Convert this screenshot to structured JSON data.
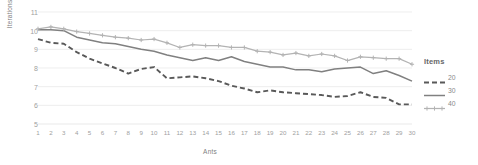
{
  "chart_data": {
    "type": "line",
    "title": "",
    "xlabel": "Ants",
    "ylabel": "Iterations",
    "xlim": [
      1,
      30
    ],
    "ylim": [
      5,
      11
    ],
    "grid": true,
    "legend_position": "right",
    "legend_title": "Items",
    "x": [
      1,
      2,
      3,
      4,
      5,
      6,
      7,
      8,
      9,
      10,
      11,
      12,
      13,
      14,
      15,
      16,
      17,
      18,
      19,
      20,
      21,
      22,
      23,
      24,
      25,
      26,
      27,
      28,
      29,
      30
    ],
    "xticklabels": [
      "1",
      "2",
      "3",
      "4",
      "5",
      "6",
      "7",
      "8",
      "9",
      "10",
      "11",
      "12",
      "13",
      "14",
      "15",
      "16",
      "17",
      "18",
      "19",
      "20",
      "21",
      "22",
      "23",
      "24",
      "25",
      "26",
      "27",
      "28",
      "29",
      "30"
    ],
    "yticklabels": [
      "5",
      "6",
      "7",
      "8",
      "9",
      "10",
      "11"
    ],
    "yticks": [
      5,
      6,
      7,
      8,
      9,
      10,
      11
    ],
    "series": [
      {
        "name": "20",
        "style": "dashed",
        "color": "#595959",
        "marker": "none",
        "values": [
          9.55,
          9.35,
          9.3,
          8.85,
          8.5,
          8.25,
          8.0,
          7.7,
          7.95,
          8.05,
          7.45,
          7.5,
          7.55,
          7.45,
          7.3,
          7.05,
          6.9,
          6.7,
          6.8,
          6.7,
          6.65,
          6.6,
          6.55,
          6.45,
          6.5,
          6.7,
          6.45,
          6.4,
          6.05,
          6.05
        ]
      },
      {
        "name": "30",
        "style": "solid",
        "color": "#808080",
        "marker": "none",
        "values": [
          10.05,
          10.05,
          10.0,
          9.65,
          9.5,
          9.35,
          9.3,
          9.15,
          9.0,
          8.9,
          8.7,
          8.55,
          8.4,
          8.55,
          8.4,
          8.6,
          8.35,
          8.2,
          8.05,
          8.05,
          7.9,
          7.9,
          7.8,
          7.95,
          8.0,
          8.05,
          7.7,
          7.85,
          7.6,
          7.3
        ]
      },
      {
        "name": "40",
        "style": "solid-marker",
        "color": "#b3b3b3",
        "marker": "plus",
        "values": [
          10.1,
          10.2,
          10.1,
          9.95,
          9.85,
          9.75,
          9.65,
          9.6,
          9.5,
          9.55,
          9.35,
          9.1,
          9.25,
          9.2,
          9.2,
          9.1,
          9.1,
          8.9,
          8.85,
          8.7,
          8.8,
          8.65,
          8.75,
          8.65,
          8.4,
          8.6,
          8.55,
          8.5,
          8.5,
          8.2
        ]
      }
    ]
  },
  "legend": {
    "title": "Items",
    "items": [
      {
        "label": "20"
      },
      {
        "label": "30"
      },
      {
        "label": "40"
      }
    ]
  }
}
